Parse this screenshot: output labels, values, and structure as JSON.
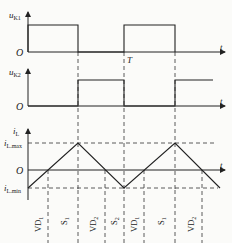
{
  "figure": {
    "panels": [
      {
        "id": "uK1",
        "axis_label_main": "u",
        "axis_label_sub": "K1",
        "origin": "O",
        "x_label": "t",
        "period_label": "T"
      },
      {
        "id": "uK2",
        "axis_label_main": "u",
        "axis_label_sub": "K2",
        "origin": "O",
        "x_label": "t"
      },
      {
        "id": "iL",
        "axis_label_main": "i",
        "axis_label_sub": "L",
        "origin": "O",
        "x_label": "t",
        "max_label_main": "i",
        "max_label_sub": "L.max",
        "min_label_main": "i",
        "min_label_sub": "L.min"
      }
    ],
    "interval_labels": [
      {
        "main": "VD",
        "sub": "1"
      },
      {
        "main": "S",
        "sub": "1"
      },
      {
        "main": "VD",
        "sub": "2"
      },
      {
        "main": "S",
        "sub": "2"
      },
      {
        "main": "VD",
        "sub": "1"
      },
      {
        "main": "S",
        "sub": "1"
      },
      {
        "main": "VD",
        "sub": "2"
      }
    ],
    "line_color": "#222222",
    "dash_color": "#333333"
  }
}
